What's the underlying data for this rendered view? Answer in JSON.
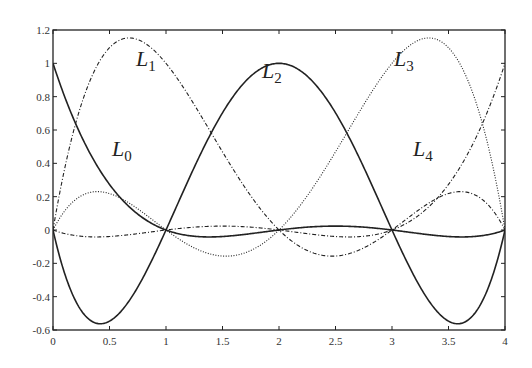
{
  "chart_data": {
    "type": "line",
    "title": "",
    "xlabel": "",
    "ylabel": "",
    "xlim": [
      0,
      4
    ],
    "ylim": [
      -0.6,
      1.2
    ],
    "grid": false,
    "x_ticks": [
      "0",
      "0.5",
      "1",
      "1.5",
      "2",
      "2.5",
      "3",
      "3.5",
      "4"
    ],
    "y_ticks": [
      "-0.6",
      "-0.4",
      "-0.2",
      "0",
      "0.2",
      "0.4",
      "0.6",
      "0.8",
      "1",
      "1.2"
    ],
    "nodes": [
      0,
      1,
      2,
      3,
      4
    ],
    "series": [
      {
        "name": "L0",
        "label": "L",
        "sub": "0",
        "style": "solid",
        "label_pos": [
          112,
          156
        ],
        "peak": {
          "x": 0,
          "y": 1
        }
      },
      {
        "name": "L1",
        "label": "L",
        "sub": "1",
        "style": "dashdot",
        "label_pos": [
          136,
          66
        ],
        "peak": {
          "x": 0.75,
          "y": 1.16
        }
      },
      {
        "name": "L2",
        "label": "L",
        "sub": "2",
        "style": "solid",
        "label_pos": [
          262,
          78
        ],
        "peak": {
          "x": 2,
          "y": 1
        }
      },
      {
        "name": "L3",
        "label": "L",
        "sub": "3",
        "style": "dotted",
        "label_pos": [
          394,
          66
        ],
        "peak": {
          "x": 3.25,
          "y": 1.16
        }
      },
      {
        "name": "L4",
        "label": "L",
        "sub": "4",
        "style": "dashdot",
        "label_pos": [
          413,
          156
        ],
        "peak": {
          "x": 4,
          "y": 1
        }
      }
    ]
  }
}
